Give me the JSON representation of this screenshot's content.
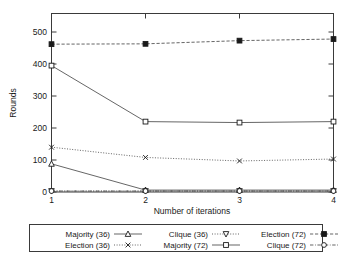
{
  "chart_data": {
    "type": "line",
    "title": "",
    "xlabel": "Number of iterations",
    "ylabel": "Rounds",
    "x": [
      1,
      2,
      3,
      4
    ],
    "xticklabels": [
      "1",
      "2",
      "3",
      "4"
    ],
    "yticklabels": [
      "0",
      "100",
      "200",
      "300",
      "400",
      "500"
    ],
    "yticks": [
      0,
      100,
      200,
      300,
      400,
      500
    ],
    "xlim": [
      1,
      4
    ],
    "ylim": [
      0,
      560
    ],
    "grid": false,
    "legend_position": "below-axes",
    "series": [
      {
        "name": "Majority (36)",
        "values": [
          88,
          6,
          6,
          6
        ],
        "marker": "triangle-up",
        "marker_filled": false,
        "linestyle": "solid"
      },
      {
        "name": "Election (36)",
        "values": [
          140,
          108,
          97,
          103
        ],
        "marker": "cross-x",
        "marker_filled": false,
        "linestyle": "dotted"
      },
      {
        "name": "Clique (36)",
        "values": [
          3,
          3,
          3,
          3
        ],
        "marker": "triangle-down",
        "marker_filled": false,
        "linestyle": "dotted"
      },
      {
        "name": "Majority (72)",
        "values": [
          395,
          220,
          217,
          220
        ],
        "marker": "square",
        "marker_filled": false,
        "linestyle": "solid"
      },
      {
        "name": "Election (72)",
        "values": [
          462,
          463,
          473,
          478
        ],
        "marker": "square",
        "marker_filled": true,
        "linestyle": "dashed"
      },
      {
        "name": "Clique (72)",
        "values": [
          3,
          3,
          3,
          3
        ],
        "marker": "circle",
        "marker_filled": false,
        "linestyle": "dashdot"
      }
    ],
    "legend_entries": [
      {
        "label": "Majority (36)",
        "column": 0,
        "row": 0
      },
      {
        "label": "Election (36)",
        "column": 0,
        "row": 1
      },
      {
        "label": "Clique (36)",
        "column": 1,
        "row": 0
      },
      {
        "label": "Majority (72)",
        "column": 1,
        "row": 1
      },
      {
        "label": "Election (72)",
        "column": 2,
        "row": 0
      },
      {
        "label": "Clique (72)",
        "column": 2,
        "row": 1
      }
    ],
    "colors": {
      "axis": "#3a3a3a",
      "series": "#4a4a4a",
      "text": "#1a1a1a",
      "background": "#ffffff"
    }
  }
}
